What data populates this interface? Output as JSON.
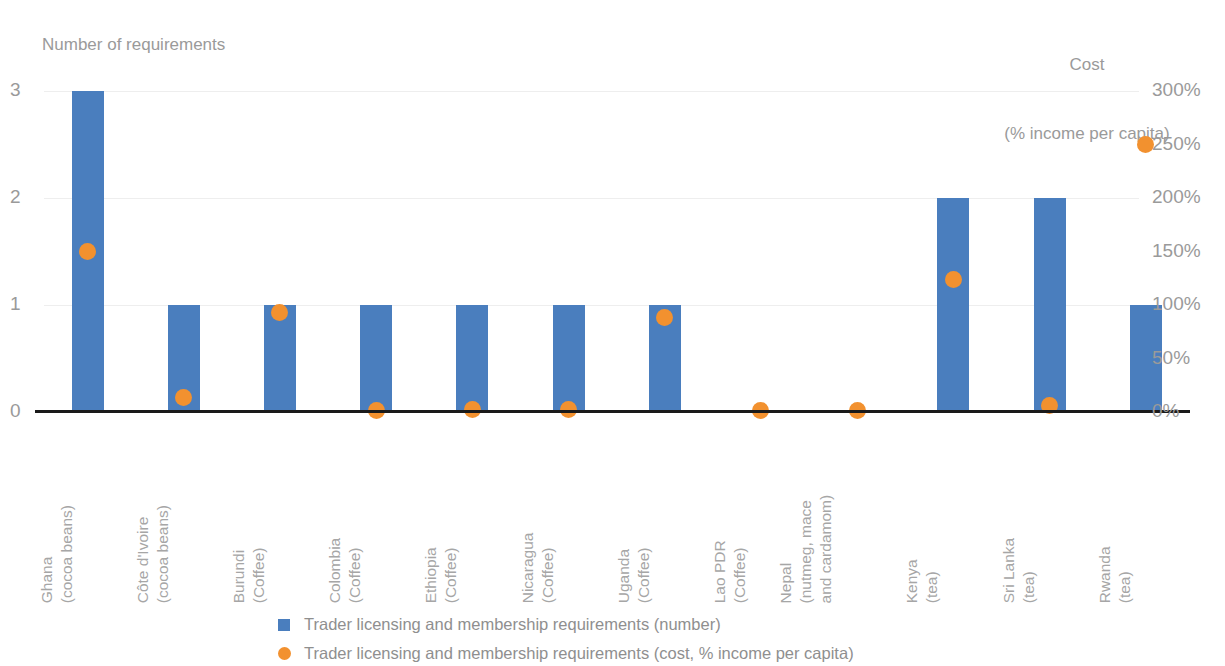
{
  "chart_data": {
    "type": "bar",
    "title": "",
    "subtitle": "",
    "left_axis_title": "Number of requirements",
    "right_axis_title_line1": "Cost",
    "right_axis_title_line2": "(% income per capita)",
    "xlabel": "",
    "ylabel": "Number of requirements",
    "y2label": "Cost (% income per capita)",
    "ylim": [
      0,
      3
    ],
    "y2lim": [
      0,
      300
    ],
    "yticks": [
      "0",
      "1",
      "2",
      "3"
    ],
    "ytick_values": [
      0,
      1,
      2,
      3
    ],
    "y2ticks": [
      "0%",
      "50%",
      "100%",
      "150%",
      "200%",
      "250%",
      "300%"
    ],
    "y2tick_values": [
      0,
      50,
      100,
      150,
      200,
      250,
      300
    ],
    "grid": true,
    "legend_position": "bottom",
    "categories": [
      "Ghana (cocoa beans)",
      "Côte d'Ivoire (cocoa beans)",
      "Burundi (Coffee)",
      "Colombia (Coffee)",
      "Ethiopia (Coffee)",
      "Nicaragua (Coffee)",
      "Uganda (Coffee)",
      "Lao PDR (Coffee)",
      "Nepal (nutmeg, mace and cardamom)",
      "Kenya (tea)",
      "Sri Lanka (tea)",
      "Rwanda (tea)"
    ],
    "category_label_lines": [
      [
        "Ghana",
        "(cocoa beans)"
      ],
      [
        "Côte d'Ivoire",
        "(cocoa beans)"
      ],
      [
        "Burundi",
        "(Coffee)"
      ],
      [
        "Colombia",
        "(Coffee)"
      ],
      [
        "Ethiopia",
        "(Coffee)"
      ],
      [
        "Nicaragua",
        "(Coffee)"
      ],
      [
        "Uganda",
        "(Coffee)"
      ],
      [
        "Lao PDR",
        "(Coffee)"
      ],
      [
        "Nepal",
        "(nutmeg, mace",
        "and cardamom)"
      ],
      [
        "Kenya",
        "(tea)"
      ],
      [
        "Sri Lanka",
        "(tea)"
      ],
      [
        "Rwanda",
        "(tea)"
      ]
    ],
    "series": [
      {
        "name": "Trader licensing and membership requirements (number)",
        "type": "bar",
        "axis": "left",
        "color": "#4a7ebe",
        "values": [
          3,
          1,
          1,
          1,
          1,
          1,
          1,
          0,
          0,
          2,
          2,
          1
        ]
      },
      {
        "name": "Trader licensing and membership requirements (cost, % income per capita)",
        "type": "scatter",
        "axis": "right",
        "color": "#f2912f",
        "values": [
          150,
          14,
          93,
          1,
          2,
          2,
          88,
          1,
          1,
          124,
          6,
          250
        ]
      }
    ]
  },
  "legend": {
    "items": [
      {
        "marker": "square",
        "color": "#4a7ebe",
        "label": "Trader licensing and membership requirements (number)"
      },
      {
        "marker": "circle",
        "color": "#f2912f",
        "label": "Trader licensing and membership requirements (cost, % income per capita)"
      }
    ]
  }
}
